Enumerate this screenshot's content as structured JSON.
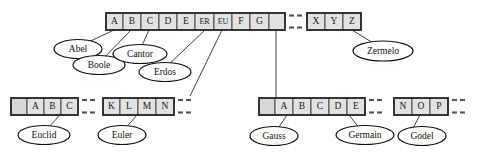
{
  "diagram": {
    "background_color": "#ffffff",
    "cell_fill": "#e2e2e2",
    "cell_stroke": "#3a3a3a",
    "frame_stroke": "#2b2b2b",
    "oval_fill": "#ffffff",
    "oval_stroke": "#111111",
    "connector_color": "#2b2b2b"
  },
  "tables": {
    "top_main": {
      "name": "top-directory-table",
      "cells": [
        "A",
        "B",
        "C",
        "D",
        "E",
        "ER",
        "EU",
        "F",
        "G"
      ]
    },
    "top_tail": {
      "name": "top-directory-table-tail",
      "cells": [
        "X",
        "Y",
        "Z"
      ]
    },
    "bottom_left": {
      "name": "bottom-left-bucket-table",
      "cells": [
        "",
        "A",
        "B",
        "C"
      ]
    },
    "bottom_mid": {
      "name": "bottom-middle-bucket-table",
      "cells": [
        "K",
        "L",
        "M",
        "N"
      ]
    },
    "bottom_right": {
      "name": "bottom-right-bucket-table",
      "cells": [
        "",
        "A",
        "B",
        "C",
        "D",
        "E"
      ]
    },
    "bottom_far_right": {
      "name": "bottom-far-right-bucket-table",
      "cells": [
        "N",
        "O",
        "P"
      ]
    }
  },
  "labels": {
    "abel": "Abel",
    "boole": "Boole",
    "cantor": "Cantor",
    "erdos": "Erdos",
    "zermelo": "Zermelo",
    "euclid": "Euclid",
    "euler": "Euler",
    "gauss": "Gauss",
    "germain": "Germain",
    "godel": "Godel"
  }
}
